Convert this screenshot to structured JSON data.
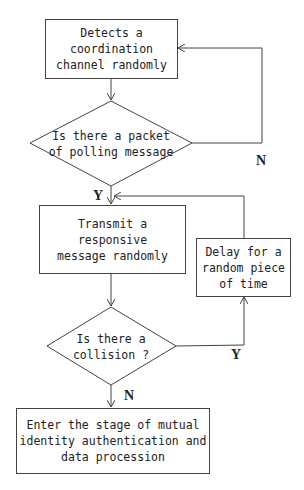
{
  "nodes": {
    "detect": {
      "type": "process",
      "text": "Detects a\ncoordination\nchannel randomly"
    },
    "polling_check": {
      "type": "decision",
      "text": "Is there a packet\nof polling message"
    },
    "transmit": {
      "type": "process",
      "text": "Transmit a responsive\nmessage randomly"
    },
    "delay": {
      "type": "process",
      "text": "Delay for a\nrandom piece\nof time"
    },
    "collision_check": {
      "type": "decision",
      "text": "Is there a\ncollision ?"
    },
    "authenticate": {
      "type": "process",
      "text": "Enter the stage of mutual\nidentity authentication and\ndata procession"
    }
  },
  "edges": [
    {
      "from": "detect",
      "to": "polling_check",
      "label": ""
    },
    {
      "from": "polling_check",
      "to": "detect",
      "label": "N"
    },
    {
      "from": "polling_check",
      "to": "transmit",
      "label": "Y"
    },
    {
      "from": "transmit",
      "to": "collision_check",
      "label": ""
    },
    {
      "from": "collision_check",
      "to": "delay",
      "label": "Y"
    },
    {
      "from": "delay",
      "to": "transmit",
      "label": ""
    },
    {
      "from": "collision_check",
      "to": "authenticate",
      "label": "N"
    }
  ],
  "labels": {
    "polling_no": "N",
    "polling_yes": "Y",
    "collision_yes": "Y",
    "collision_no": "N"
  },
  "colors": {
    "line": "#444444",
    "background": "#ffffff",
    "text": "#222222"
  }
}
